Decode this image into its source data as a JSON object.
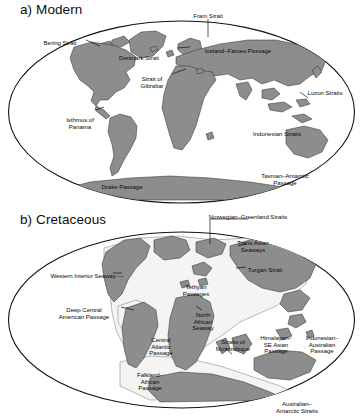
{
  "figure": {
    "type": "two-panel world map diagram",
    "background": "#ffffff",
    "projection": "Mollweide / elliptical world projection",
    "colors": {
      "land": "#8d8d8d",
      "land_stroke": "#2b2b2b",
      "ocean": "#ffffff",
      "shelf": "#f2f2f2",
      "shelf_stroke": "#555555",
      "ellipse_stroke": "#111111",
      "text": "#0b0b0b",
      "leader_line": "#111111"
    }
  },
  "panels": [
    {
      "id": "modern",
      "title": "a) Modern",
      "labels": [
        {
          "text": "Fram Strait",
          "x": 208,
          "y": 13,
          "align": "c"
        },
        {
          "text": "Bering Strait",
          "x": 60,
          "y": 40,
          "align": "c"
        },
        {
          "text": "Denmark Strait",
          "x": 139,
          "y": 55,
          "align": "c"
        },
        {
          "text": "Iceland–Faroes Passage",
          "x": 238,
          "y": 48,
          "align": "c"
        },
        {
          "text": "Strait of\nGibraltar",
          "x": 152,
          "y": 76,
          "align": "c"
        },
        {
          "text": "Luzon Straits",
          "x": 325,
          "y": 90,
          "align": "c"
        },
        {
          "text": "Isthmus of\nPanama",
          "x": 80,
          "y": 117,
          "align": "c"
        },
        {
          "text": "Indonesian Straits",
          "x": 277,
          "y": 131,
          "align": "c"
        },
        {
          "text": "Tasman–Antarctic\nPassage",
          "x": 285,
          "y": 173,
          "align": "c"
        },
        {
          "text": "Drake Passage",
          "x": 122,
          "y": 184,
          "align": "c"
        }
      ]
    },
    {
      "id": "cretaceous",
      "title": "b) Cretaceous",
      "labels": [
        {
          "text": "Norwegian–Greenland Straits",
          "x": 248,
          "y": 4,
          "align": "c"
        },
        {
          "text": "Trans Asian\nSeaways",
          "x": 253,
          "y": 30,
          "align": "c"
        },
        {
          "text": "Turgan Strait",
          "x": 265,
          "y": 57,
          "align": "c"
        },
        {
          "text": "Western Interior Seaway —",
          "x": 87,
          "y": 63,
          "align": "c"
        },
        {
          "text": "Tethyan\nPassages",
          "x": 196,
          "y": 74,
          "align": "c"
        },
        {
          "text": "Deep Central\nAmerican Passage",
          "x": 84,
          "y": 97,
          "align": "c"
        },
        {
          "text": "North\nAfrican\nSeaway",
          "x": 203,
          "y": 102,
          "align": "c"
        },
        {
          "text": "Central\nAtlantic\nPassage",
          "x": 161,
          "y": 127,
          "align": "c"
        },
        {
          "text": "Straits of\nMozambique",
          "x": 233,
          "y": 129,
          "align": "c"
        },
        {
          "text": "Himalayan–\nSE Asian\nPassage",
          "x": 276,
          "y": 125,
          "align": "c"
        },
        {
          "text": "Indonesian–\nAustralian\nPassage",
          "x": 322,
          "y": 125,
          "align": "c"
        },
        {
          "text": "Falkland–\nAfrican\nPassage",
          "x": 150,
          "y": 162,
          "align": "c"
        },
        {
          "text": "Australian–\nAntarctic Straits",
          "x": 297,
          "y": 191,
          "align": "c"
        }
      ]
    }
  ]
}
